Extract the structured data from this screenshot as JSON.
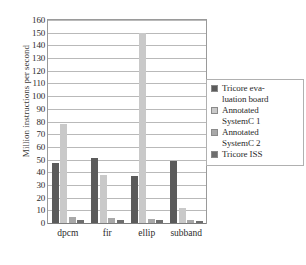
{
  "chart_data": {
    "type": "bar",
    "title": "",
    "xlabel": "",
    "ylabel": "Million instructions per second",
    "ylim": [
      0,
      160
    ],
    "ystep": 10,
    "grid": true,
    "legend_position": "right",
    "categories": [
      "dpcm",
      "fir",
      "ellip",
      "subband"
    ],
    "yticks": [
      "160",
      "150",
      "140",
      "130",
      "120",
      "110",
      "100",
      "90",
      "80",
      "70",
      "60",
      "50",
      "40",
      "30",
      "20",
      "10",
      "0"
    ],
    "series": [
      {
        "name": "Tricore evaluation board",
        "color": "#5b5b5b",
        "values": [
          47,
          51,
          37,
          49
        ]
      },
      {
        "name": "Annotated SystemC 1",
        "color": "#c9c9c9",
        "values": [
          78,
          38,
          150,
          12
        ]
      },
      {
        "name": "Annotated SystemC 2",
        "color": "#a8a8a8",
        "values": [
          5,
          4,
          3,
          2
        ]
      },
      {
        "name": "Tricore ISS",
        "color": "#6e6e6e",
        "values": [
          2.5,
          2,
          2.5,
          1.5
        ]
      }
    ]
  },
  "legend": {
    "entries": [
      {
        "label": "Tricore eva-\nluation board",
        "line1": "Tricore eva-",
        "line2": "luation board"
      },
      {
        "label": "Annotated SystemC 1",
        "line1": "Annotated",
        "line2": "SystemC 1"
      },
      {
        "label": "Annotated SystemC 2",
        "line1": "Annotated",
        "line2": "SystemC 2"
      },
      {
        "label": "Tricore ISS",
        "line1": "Tricore ISS",
        "line2": ""
      }
    ]
  }
}
